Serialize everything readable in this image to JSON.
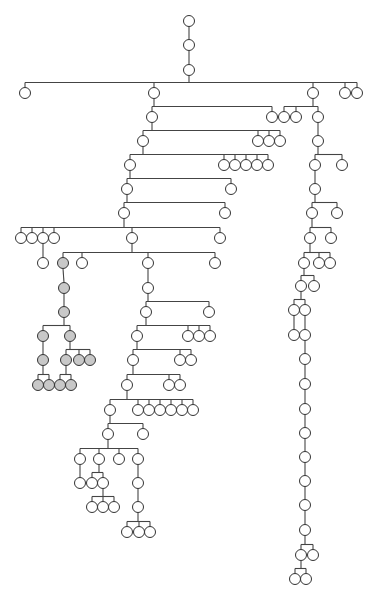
{
  "diagram": {
    "type": "tree",
    "node_radius": 5.5,
    "colors": {
      "node_fill": "#ffffff",
      "shaded_fill": "#c8c8c8",
      "stroke": "#333333",
      "edge": "#444444"
    },
    "nodes": [
      {
        "id": "r1",
        "x": 189,
        "y": 21
      },
      {
        "id": "r2",
        "x": 189,
        "y": 45,
        "p": "r1"
      },
      {
        "id": "r3",
        "x": 189,
        "y": 70,
        "p": "r2"
      },
      {
        "id": "a1",
        "x": 25,
        "y": 93,
        "p": "r3"
      },
      {
        "id": "a2",
        "x": 154,
        "y": 93,
        "p": "r3"
      },
      {
        "id": "a3",
        "x": 313,
        "y": 93,
        "p": "r3"
      },
      {
        "id": "a4",
        "x": 345,
        "y": 93,
        "p": "r3"
      },
      {
        "id": "a5",
        "x": 357,
        "y": 93,
        "p": "r3"
      },
      {
        "id": "b1",
        "x": 152,
        "y": 117,
        "p": "a2"
      },
      {
        "id": "b2",
        "x": 272,
        "y": 117,
        "p": "a2"
      },
      {
        "id": "c1",
        "x": 284,
        "y": 117,
        "p": "a3"
      },
      {
        "id": "c2",
        "x": 296,
        "y": 117,
        "p": "a3"
      },
      {
        "id": "c3",
        "x": 318,
        "y": 117,
        "p": "a3"
      },
      {
        "id": "b3",
        "x": 143,
        "y": 141,
        "p": "b1"
      },
      {
        "id": "b4",
        "x": 258,
        "y": 141,
        "p": "b1"
      },
      {
        "id": "b5",
        "x": 269,
        "y": 141,
        "p": "b1"
      },
      {
        "id": "b6",
        "x": 280,
        "y": 141,
        "p": "b1"
      },
      {
        "id": "c4",
        "x": 318,
        "y": 141,
        "p": "c3"
      },
      {
        "id": "b7",
        "x": 130,
        "y": 165,
        "p": "b3"
      },
      {
        "id": "b8",
        "x": 224,
        "y": 165,
        "p": "b3"
      },
      {
        "id": "b9",
        "x": 235,
        "y": 165,
        "p": "b3"
      },
      {
        "id": "b10",
        "x": 246,
        "y": 165,
        "p": "b3"
      },
      {
        "id": "b11",
        "x": 257,
        "y": 165,
        "p": "b3"
      },
      {
        "id": "b12",
        "x": 268,
        "y": 165,
        "p": "b3"
      },
      {
        "id": "c5",
        "x": 315,
        "y": 165,
        "p": "c4"
      },
      {
        "id": "c6",
        "x": 342,
        "y": 165,
        "p": "c4"
      },
      {
        "id": "b13",
        "x": 127,
        "y": 189,
        "p": "b7"
      },
      {
        "id": "b14",
        "x": 231,
        "y": 189,
        "p": "b7"
      },
      {
        "id": "c7",
        "x": 315,
        "y": 189,
        "p": "c5"
      },
      {
        "id": "b15",
        "x": 124,
        "y": 213,
        "p": "b13"
      },
      {
        "id": "b16",
        "x": 225,
        "y": 213,
        "p": "b13"
      },
      {
        "id": "c8",
        "x": 312,
        "y": 213,
        "p": "c7"
      },
      {
        "id": "c9",
        "x": 337,
        "y": 213,
        "p": "c7"
      },
      {
        "id": "d1",
        "x": 21,
        "y": 238,
        "p": "b15"
      },
      {
        "id": "d2",
        "x": 32,
        "y": 238,
        "p": "b15"
      },
      {
        "id": "d3",
        "x": 43,
        "y": 238,
        "p": "b15"
      },
      {
        "id": "d4",
        "x": 54,
        "y": 238,
        "p": "b15"
      },
      {
        "id": "d5",
        "x": 132,
        "y": 238,
        "p": "b15"
      },
      {
        "id": "d6",
        "x": 220,
        "y": 238,
        "p": "b15"
      },
      {
        "id": "c10",
        "x": 310,
        "y": 238,
        "p": "c8"
      },
      {
        "id": "c11",
        "x": 331,
        "y": 238,
        "p": "c8"
      },
      {
        "id": "e1",
        "x": 43,
        "y": 263,
        "p": "d3"
      },
      {
        "id": "s1",
        "x": 63,
        "y": 263,
        "p": "d5",
        "shaded": true
      },
      {
        "id": "e2",
        "x": 82,
        "y": 263,
        "p": "d5"
      },
      {
        "id": "e3",
        "x": 148,
        "y": 263,
        "p": "d5"
      },
      {
        "id": "e4",
        "x": 215,
        "y": 263,
        "p": "d5"
      },
      {
        "id": "c12",
        "x": 304,
        "y": 263,
        "p": "c10"
      },
      {
        "id": "c13",
        "x": 319,
        "y": 263,
        "p": "c10"
      },
      {
        "id": "c14",
        "x": 330,
        "y": 263,
        "p": "c10"
      },
      {
        "id": "s2",
        "x": 64,
        "y": 288,
        "p": "s1",
        "shaded": true
      },
      {
        "id": "e5",
        "x": 148,
        "y": 288,
        "p": "e3"
      },
      {
        "id": "c15",
        "x": 301,
        "y": 286,
        "p": "c12"
      },
      {
        "id": "c16",
        "x": 314,
        "y": 286,
        "p": "c12"
      },
      {
        "id": "s3",
        "x": 64,
        "y": 312,
        "p": "s2",
        "shaded": true
      },
      {
        "id": "e6",
        "x": 146,
        "y": 312,
        "p": "e5"
      },
      {
        "id": "e7",
        "x": 209,
        "y": 312,
        "p": "e5"
      },
      {
        "id": "c17",
        "x": 294,
        "y": 310,
        "p": "c15"
      },
      {
        "id": "c18",
        "x": 305,
        "y": 310,
        "p": "c15"
      },
      {
        "id": "s4",
        "x": 43,
        "y": 336,
        "p": "s3",
        "shaded": true
      },
      {
        "id": "s5",
        "x": 70,
        "y": 336,
        "p": "s3",
        "shaded": true
      },
      {
        "id": "e8",
        "x": 137,
        "y": 336,
        "p": "e6"
      },
      {
        "id": "e9",
        "x": 188,
        "y": 336,
        "p": "e6"
      },
      {
        "id": "e10",
        "x": 199,
        "y": 336,
        "p": "e6"
      },
      {
        "id": "e11",
        "x": 210,
        "y": 336,
        "p": "e6"
      },
      {
        "id": "c19",
        "x": 294,
        "y": 335,
        "p": "c17"
      },
      {
        "id": "c20",
        "x": 305,
        "y": 335,
        "p": "c18"
      },
      {
        "id": "s6",
        "x": 43,
        "y": 360,
        "p": "s4",
        "shaded": true
      },
      {
        "id": "s7",
        "x": 66,
        "y": 360,
        "p": "s5",
        "shaded": true
      },
      {
        "id": "s8",
        "x": 79,
        "y": 360,
        "p": "s5",
        "shaded": true
      },
      {
        "id": "s9",
        "x": 90,
        "y": 360,
        "p": "s5",
        "shaded": true
      },
      {
        "id": "e12",
        "x": 133,
        "y": 360,
        "p": "e8"
      },
      {
        "id": "e13",
        "x": 180,
        "y": 360,
        "p": "e8"
      },
      {
        "id": "e14",
        "x": 191,
        "y": 360,
        "p": "e8"
      },
      {
        "id": "c21",
        "x": 305,
        "y": 359,
        "p": "c20"
      },
      {
        "id": "s10",
        "x": 38,
        "y": 385,
        "p": "s6",
        "shaded": true
      },
      {
        "id": "s11",
        "x": 49,
        "y": 385,
        "p": "s6",
        "shaded": true
      },
      {
        "id": "s12",
        "x": 60,
        "y": 385,
        "p": "s7",
        "shaded": true
      },
      {
        "id": "s13",
        "x": 71,
        "y": 385,
        "p": "s7",
        "shaded": true
      },
      {
        "id": "e15",
        "x": 127,
        "y": 385,
        "p": "e12"
      },
      {
        "id": "e16",
        "x": 169,
        "y": 385,
        "p": "e12"
      },
      {
        "id": "e17",
        "x": 180,
        "y": 385,
        "p": "e12"
      },
      {
        "id": "c22",
        "x": 305,
        "y": 384,
        "p": "c21"
      },
      {
        "id": "f1",
        "x": 110,
        "y": 410,
        "p": "e15"
      },
      {
        "id": "f2",
        "x": 138,
        "y": 410,
        "p": "e15"
      },
      {
        "id": "f3",
        "x": 149,
        "y": 410,
        "p": "e15"
      },
      {
        "id": "f4",
        "x": 160,
        "y": 410,
        "p": "e15"
      },
      {
        "id": "f5",
        "x": 171,
        "y": 410,
        "p": "e15"
      },
      {
        "id": "f6",
        "x": 182,
        "y": 410,
        "p": "e15"
      },
      {
        "id": "f7",
        "x": 193,
        "y": 410,
        "p": "e15"
      },
      {
        "id": "c23",
        "x": 305,
        "y": 409,
        "p": "c22"
      },
      {
        "id": "g1",
        "x": 108,
        "y": 434,
        "p": "f1"
      },
      {
        "id": "g2",
        "x": 143,
        "y": 434,
        "p": "f1"
      },
      {
        "id": "c24",
        "x": 305,
        "y": 433,
        "p": "c23"
      },
      {
        "id": "h1",
        "x": 80,
        "y": 459,
        "p": "g1"
      },
      {
        "id": "h2",
        "x": 99,
        "y": 459,
        "p": "g1"
      },
      {
        "id": "h3",
        "x": 119,
        "y": 459,
        "p": "g1"
      },
      {
        "id": "h4",
        "x": 138,
        "y": 459,
        "p": "g1"
      },
      {
        "id": "c25",
        "x": 305,
        "y": 457,
        "p": "c24"
      },
      {
        "id": "i1",
        "x": 80,
        "y": 483,
        "p": "h1"
      },
      {
        "id": "i2",
        "x": 92,
        "y": 483,
        "p": "h2"
      },
      {
        "id": "i3",
        "x": 103,
        "y": 483,
        "p": "h2"
      },
      {
        "id": "i4",
        "x": 138,
        "y": 483,
        "p": "h4"
      },
      {
        "id": "c26",
        "x": 305,
        "y": 481,
        "p": "c25"
      },
      {
        "id": "j1",
        "x": 92,
        "y": 507,
        "p": "i3"
      },
      {
        "id": "j2",
        "x": 103,
        "y": 507,
        "p": "i3"
      },
      {
        "id": "j3",
        "x": 114,
        "y": 507,
        "p": "i3"
      },
      {
        "id": "i5",
        "x": 138,
        "y": 507,
        "p": "i4"
      },
      {
        "id": "c27",
        "x": 305,
        "y": 505,
        "p": "c26"
      },
      {
        "id": "k1",
        "x": 127,
        "y": 532,
        "p": "i5"
      },
      {
        "id": "k2",
        "x": 139,
        "y": 532,
        "p": "i5"
      },
      {
        "id": "k3",
        "x": 150,
        "y": 532,
        "p": "i5"
      },
      {
        "id": "c28",
        "x": 305,
        "y": 530,
        "p": "c27"
      },
      {
        "id": "c29",
        "x": 301,
        "y": 555,
        "p": "c28"
      },
      {
        "id": "c30",
        "x": 313,
        "y": 555,
        "p": "c28"
      },
      {
        "id": "c31",
        "x": 295,
        "y": 579,
        "p": "c29"
      },
      {
        "id": "c32",
        "x": 306,
        "y": 579,
        "p": "c29"
      }
    ]
  }
}
